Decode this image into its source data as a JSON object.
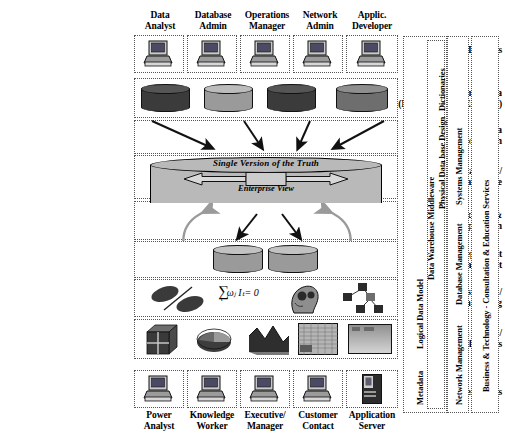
{
  "diagram": {
    "stages": [
      {
        "id": "it-users",
        "lines": [
          "IT Users"
        ]
      },
      {
        "id": "source-data",
        "lines": [
          "Source Data",
          "(Internal and/or External)"
        ]
      },
      {
        "id": "data-transformation",
        "lines": [
          "Data",
          "Transformation"
        ]
      },
      {
        "id": "enterprise-warehouse",
        "lines": [
          "Independent Data Mart /",
          "Enterprise Warehouse"
        ]
      },
      {
        "id": "replication",
        "lines": [
          "Replication &",
          "Propagation"
        ]
      },
      {
        "id": "dependent-data-mart",
        "lines": [
          "Dependent",
          "Data Mart"
        ]
      },
      {
        "id": "knowledge-discovery",
        "lines": [
          "Knowledge Discovery /",
          "Data Mining"
        ]
      },
      {
        "id": "information-access",
        "lines": [
          "Information Access /",
          "Applications"
        ]
      },
      {
        "id": "business-users",
        "lines": [
          "Business Users"
        ]
      }
    ],
    "it_user_roles": [
      {
        "id": "data-analyst",
        "lines": [
          "Data",
          "Analyst"
        ]
      },
      {
        "id": "database-admin",
        "lines": [
          "Database",
          "Admin"
        ]
      },
      {
        "id": "operations-manager",
        "lines": [
          "Operations",
          "Manager"
        ]
      },
      {
        "id": "network-admin",
        "lines": [
          "Network",
          "Admin"
        ]
      },
      {
        "id": "applic-developer",
        "lines": [
          "Applic.",
          "Developer"
        ]
      }
    ],
    "business_user_roles": [
      {
        "id": "power-analyst",
        "lines": [
          "Power",
          "Analyst"
        ]
      },
      {
        "id": "knowledge-worker",
        "lines": [
          "Knowledge",
          "Worker"
        ]
      },
      {
        "id": "executive-manager",
        "lines": [
          "Executive/",
          "Manager"
        ]
      },
      {
        "id": "customer-contact",
        "lines": [
          "Customer",
          "Contact"
        ]
      },
      {
        "id": "application-server",
        "lines": [
          "Application",
          "Server"
        ]
      }
    ],
    "warehouse": {
      "title": "Single Version of the Truth",
      "subtitle": "Enterprise View"
    },
    "data_mining": {
      "formula": "∑",
      "formula_sub": "t",
      "formula_rest": "ωⱼ Iₜ= 0"
    },
    "service_columns": [
      {
        "id": "metadata-middleware",
        "labels": [
          "Metadata",
          "Logical Data Model",
          "Data Warehouse Middleware",
          "Physical Data base Design",
          "Dictionaries"
        ]
      },
      {
        "id": "management-services",
        "labels": [
          "Network Management",
          "Database Management",
          "Systems Management"
        ]
      },
      {
        "id": "business-technology",
        "labels": [
          "Business & Technology - Consultation & Education Services"
        ]
      }
    ],
    "colors": {
      "cylinder_dark": "#3b3b3b",
      "cylinder_mid": "#6e6e6e",
      "cylinder_light": "#9a9a9a",
      "warehouse_fill": "#b9b9b9",
      "arrow_black": "#111111",
      "arrow_gray": "#9a9a9a",
      "dotted_border": "#555555"
    }
  }
}
